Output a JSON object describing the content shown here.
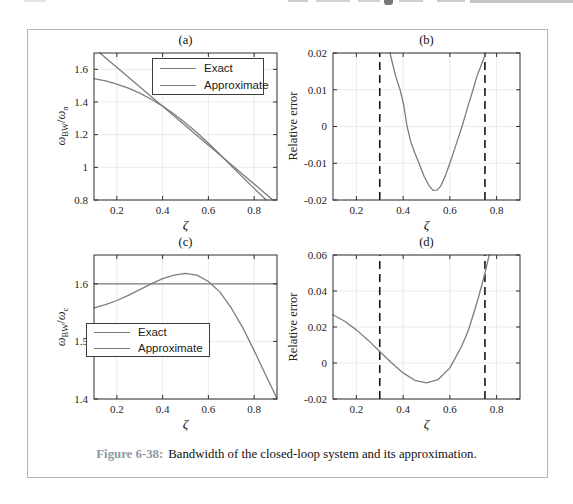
{
  "caption": {
    "label": "Figure 6-38:",
    "text": "Bandwidth of the closed-loop system and its approximation."
  },
  "colors": {
    "curve": "#7d7d7d",
    "axis": "#2e2e2e",
    "grid": "#ebebeb",
    "dashed_line": "#151515",
    "legend_border": "#3c3c3c",
    "caption_label": "#8d99a3",
    "box_border": "#b3b6b8"
  },
  "chart_data": [
    {
      "id": "a",
      "type": "line",
      "title": "(a)",
      "xlabel": "ζ",
      "ylabel": {
        "num": "ω",
        "num_sub": "BW",
        "sep": "/",
        "den": "ω",
        "den_sub": "n"
      },
      "xlim": [
        0.1,
        0.9
      ],
      "ylim": [
        0.8,
        1.7
      ],
      "xticks": [
        0.2,
        0.4,
        0.6,
        0.8
      ],
      "xtick_labels": [
        "0.2",
        "0.4",
        "0.6",
        "0.8"
      ],
      "yticks": [
        0.8,
        1.0,
        1.2,
        1.4,
        1.6
      ],
      "ytick_labels": [
        "0.8",
        "1",
        "1.2",
        "1.4",
        "1.6"
      ],
      "grid": true,
      "legend_position": "upper-right",
      "series": [
        {
          "name": "Exact",
          "points": [
            [
              0.1,
              1.543
            ],
            [
              0.15,
              1.529
            ],
            [
              0.2,
              1.51
            ],
            [
              0.25,
              1.485
            ],
            [
              0.3,
              1.454
            ],
            [
              0.35,
              1.417
            ],
            [
              0.4,
              1.375
            ],
            [
              0.45,
              1.326
            ],
            [
              0.5,
              1.272
            ],
            [
              0.55,
              1.213
            ],
            [
              0.6,
              1.148
            ],
            [
              0.65,
              1.08
            ],
            [
              0.7,
              1.01
            ],
            [
              0.75,
              0.94
            ],
            [
              0.8,
              0.871
            ],
            [
              0.853,
              0.8
            ]
          ]
        },
        {
          "name": "Approximate",
          "points": [
            [
              0.126,
              1.7
            ],
            [
              0.882,
              0.8
            ]
          ]
        }
      ]
    },
    {
      "id": "b",
      "type": "line",
      "title": "(b)",
      "xlabel": "ζ",
      "ylabel_text": "Relative error",
      "xlim": [
        0.1,
        0.9
      ],
      "ylim": [
        -0.02,
        0.02
      ],
      "xticks": [
        0.2,
        0.4,
        0.6,
        0.8
      ],
      "xtick_labels": [
        "0.2",
        "0.4",
        "0.6",
        "0.8"
      ],
      "yticks": [
        -0.02,
        -0.01,
        0,
        0.01,
        0.02
      ],
      "ytick_labels": [
        "-0.02",
        "-0.01",
        "0",
        "0.01",
        "0.02"
      ],
      "grid": true,
      "vlines": [
        0.3,
        0.75
      ],
      "vline_style": "dashed",
      "series": [
        {
          "name": "",
          "points": [
            [
              0.344,
              0.02
            ],
            [
              0.355,
              0.017
            ],
            [
              0.37,
              0.0133
            ],
            [
              0.387,
              0.01
            ],
            [
              0.402,
              0.006
            ],
            [
              0.417,
              0.0
            ],
            [
              0.432,
              -0.004
            ],
            [
              0.45,
              -0.0072
            ],
            [
              0.468,
              -0.01
            ],
            [
              0.49,
              -0.0136
            ],
            [
              0.51,
              -0.016
            ],
            [
              0.528,
              -0.0174
            ],
            [
              0.545,
              -0.0173
            ],
            [
              0.56,
              -0.0163
            ],
            [
              0.58,
              -0.0135
            ],
            [
              0.6,
              -0.01
            ],
            [
              0.625,
              -0.0052
            ],
            [
              0.652,
              0.0
            ],
            [
              0.675,
              0.005
            ],
            [
              0.699,
              0.01
            ],
            [
              0.715,
              0.0135
            ],
            [
              0.73,
              0.016
            ],
            [
              0.745,
              0.0185
            ],
            [
              0.754,
              0.02
            ]
          ]
        }
      ]
    },
    {
      "id": "c",
      "type": "line",
      "title": "(c)",
      "xlabel": "ζ",
      "ylabel": {
        "num": "ω",
        "num_sub": "BW",
        "sep": "/",
        "den": "ω",
        "den_sub": "c"
      },
      "xlim": [
        0.1,
        0.9
      ],
      "ylim": [
        1.4,
        1.65
      ],
      "xticks": [
        0.2,
        0.4,
        0.6,
        0.8
      ],
      "xtick_labels": [
        "0.2",
        "0.4",
        "0.6",
        "0.8"
      ],
      "yticks": [
        1.4,
        1.5,
        1.6
      ],
      "ytick_labels": [
        "1.4",
        "1.5",
        "1.6"
      ],
      "grid": true,
      "legend_position": "center-left",
      "series": [
        {
          "name": "Exact",
          "points": [
            [
              0.1,
              1.558
            ],
            [
              0.15,
              1.564
            ],
            [
              0.2,
              1.571
            ],
            [
              0.25,
              1.58
            ],
            [
              0.3,
              1.59
            ],
            [
              0.35,
              1.6
            ],
            [
              0.4,
              1.609
            ],
            [
              0.45,
              1.615
            ],
            [
              0.5,
              1.618
            ],
            [
              0.55,
              1.615
            ],
            [
              0.6,
              1.604
            ],
            [
              0.65,
              1.586
            ],
            [
              0.7,
              1.558
            ],
            [
              0.75,
              1.524
            ],
            [
              0.8,
              1.484
            ],
            [
              0.85,
              1.442
            ],
            [
              0.9,
              1.401
            ]
          ]
        },
        {
          "name": "Approximate",
          "points": [
            [
              0.1,
              1.6
            ],
            [
              0.9,
              1.6
            ]
          ]
        }
      ]
    },
    {
      "id": "d",
      "type": "line",
      "title": "(d)",
      "xlabel": "ζ",
      "ylabel_text": "Relative error",
      "xlim": [
        0.1,
        0.9
      ],
      "ylim": [
        -0.02,
        0.06
      ],
      "xticks": [
        0.2,
        0.4,
        0.6,
        0.8
      ],
      "xtick_labels": [
        "0.2",
        "0.4",
        "0.6",
        "0.8"
      ],
      "yticks": [
        -0.02,
        0,
        0.02,
        0.04,
        0.06
      ],
      "ytick_labels": [
        "-0.02",
        "0",
        "0.02",
        "0.04",
        "0.06"
      ],
      "grid": true,
      "vlines": [
        0.3,
        0.75
      ],
      "vline_style": "dashed",
      "series": [
        {
          "name": "",
          "points": [
            [
              0.1,
              0.0268
            ],
            [
              0.15,
              0.0232
            ],
            [
              0.2,
              0.0184
            ],
            [
              0.25,
              0.0127
            ],
            [
              0.3,
              0.0064
            ],
            [
              0.35,
              0.0001
            ],
            [
              0.4,
              -0.0055
            ],
            [
              0.45,
              -0.0096
            ],
            [
              0.5,
              -0.0111
            ],
            [
              0.55,
              -0.0092
            ],
            [
              0.6,
              -0.0027
            ],
            [
              0.65,
              0.0092
            ],
            [
              0.68,
              0.0185
            ],
            [
              0.7,
              0.0268
            ],
            [
              0.72,
              0.0354
            ],
            [
              0.74,
              0.045
            ],
            [
              0.75,
              0.05
            ],
            [
              0.76,
              0.0553
            ],
            [
              0.768,
              0.06
            ]
          ]
        }
      ]
    }
  ]
}
